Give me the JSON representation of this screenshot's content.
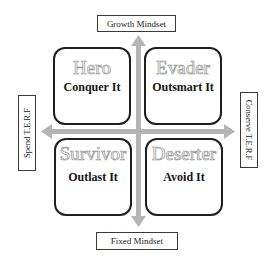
{
  "axes": {
    "top": "Growth Mindset",
    "bottom": "Fixed Mindset",
    "left": "Spend T.E.R.F",
    "right": "Conserve T.E.R.F"
  },
  "quadrants": [
    {
      "position": "top-left",
      "title": "Hero",
      "subtitle": "Conquer It"
    },
    {
      "position": "top-right",
      "title": "Evader",
      "subtitle": "Outsmart It"
    },
    {
      "position": "bottom-left",
      "title": "Survivor",
      "subtitle": "Outlast It"
    },
    {
      "position": "bottom-right",
      "title": "Deserter",
      "subtitle": "Avoid It"
    }
  ],
  "colors": {
    "arrow": "#b3b3b3",
    "border": "#1f1f1f",
    "title_outline": "#9a9a9a"
  }
}
